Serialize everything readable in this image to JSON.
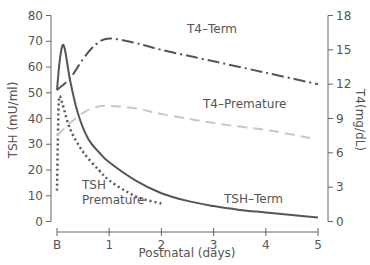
{
  "chart_data": {
    "type": "line",
    "title": "",
    "xlabel": "Postnatal (days)",
    "ylabel_left": "TSH (mU/ml)",
    "ylabel_right": "T4(mg/dL)",
    "x_ticks": [
      "B",
      "1",
      "2",
      "3",
      "4",
      "5"
    ],
    "x_range": [
      0,
      5
    ],
    "y_left_ticks": [
      0,
      10,
      20,
      30,
      40,
      50,
      60,
      70,
      80
    ],
    "y_left_range": [
      0,
      80
    ],
    "y_right_ticks": [
      0,
      3,
      6,
      9,
      12,
      15,
      18
    ],
    "y_right_range": [
      0,
      18
    ],
    "grid": false,
    "legend": "inline labels",
    "series": [
      {
        "name": "TSH–Term",
        "axis": "left",
        "style": "solid",
        "color": "#555555",
        "points": [
          [
            0,
            51
          ],
          [
            0.05,
            62
          ],
          [
            0.1,
            68
          ],
          [
            0.15,
            67
          ],
          [
            0.25,
            55
          ],
          [
            0.4,
            42
          ],
          [
            0.6,
            32
          ],
          [
            0.8,
            27
          ],
          [
            1,
            23
          ],
          [
            1.5,
            16
          ],
          [
            2,
            11
          ],
          [
            2.5,
            8
          ],
          [
            3,
            6
          ],
          [
            3.5,
            4.5
          ],
          [
            4,
            3.5
          ],
          [
            4.5,
            2.5
          ],
          [
            5,
            1.5
          ]
        ]
      },
      {
        "name": "TSH Premature",
        "axis": "left",
        "style": "dotted",
        "color": "#555555",
        "points": [
          [
            0,
            12
          ],
          [
            0.02,
            35
          ],
          [
            0.04,
            48
          ],
          [
            0.1,
            46
          ],
          [
            0.25,
            36
          ],
          [
            0.5,
            27
          ],
          [
            0.8,
            20
          ],
          [
            1,
            16
          ],
          [
            1.3,
            12
          ],
          [
            1.6,
            9
          ],
          [
            2,
            7
          ]
        ]
      },
      {
        "name": "T4–Term",
        "axis": "right",
        "style": "dash-dot",
        "color": "#555555",
        "points": [
          [
            0,
            11.5
          ],
          [
            0.25,
            12.5
          ],
          [
            0.5,
            14.2
          ],
          [
            0.75,
            15.5
          ],
          [
            1,
            16
          ],
          [
            1.5,
            15.6
          ],
          [
            2,
            15
          ],
          [
            3,
            14
          ],
          [
            4,
            13
          ],
          [
            5,
            12
          ]
        ]
      },
      {
        "name": "T4–Premature",
        "axis": "right",
        "style": "dashed",
        "color": "#c8c8c8",
        "points": [
          [
            0,
            7.5
          ],
          [
            0.25,
            8.6
          ],
          [
            0.5,
            9.5
          ],
          [
            0.75,
            10
          ],
          [
            1,
            10.1
          ],
          [
            1.5,
            9.9
          ],
          [
            2,
            9.4
          ],
          [
            3,
            8.6
          ],
          [
            4,
            8
          ],
          [
            4.85,
            7.3
          ]
        ]
      }
    ],
    "annotations": [
      {
        "text": "T4–Term",
        "x_px": 187,
        "y_px": 33
      },
      {
        "text": "T4–Premature",
        "x_px": 203,
        "y_px": 108
      },
      {
        "text": "TSH",
        "x_px": 82,
        "y_px": 189
      },
      {
        "text": "Premature",
        "x_px": 82,
        "y_px": 204
      },
      {
        "text": "TSH–Term",
        "x_px": 224,
        "y_px": 203
      }
    ]
  }
}
